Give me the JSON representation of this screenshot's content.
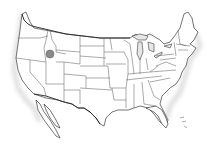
{
  "map": {
    "region": "United States (contiguous) state outlines",
    "style": "grayscale line drawing",
    "colors": {
      "background": "#ffffff",
      "outline": "#3a3a3a",
      "lakes": "#e6e6e6",
      "marker": "#8a8a8a"
    },
    "markers": [
      {
        "name": "location-marker",
        "state": "Idaho",
        "x": 50,
        "y": 54,
        "r": 4
      }
    ]
  }
}
